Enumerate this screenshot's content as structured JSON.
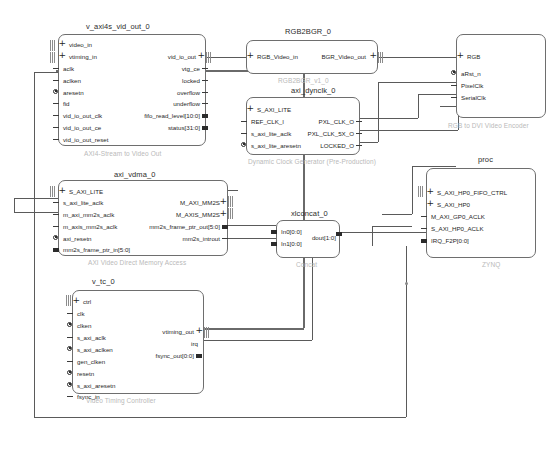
{
  "diagram": {
    "tool": "Vivado IP Integrator Block Design",
    "blocks": [
      {
        "id": "v_axi4s_vid_out_0",
        "title": "v_axi4s_vid_out_0",
        "subtitle": "AXI4-Stream to Video Out",
        "left_ports": [
          {
            "label": "video_in",
            "kind": "iface"
          },
          {
            "label": "vtiming_in",
            "kind": "iface"
          },
          {
            "label": "aclk",
            "kind": "dash"
          },
          {
            "label": "aclken",
            "kind": "dash"
          },
          {
            "label": "aresetn",
            "kind": "rstdot"
          },
          {
            "label": "fid",
            "kind": "dash"
          },
          {
            "label": "vid_io_out_clk",
            "kind": "dash"
          },
          {
            "label": "vid_io_out_ce",
            "kind": "dash"
          },
          {
            "label": "vid_io_out_reset",
            "kind": "dash"
          }
        ],
        "right_ports": [
          {
            "label": "vid_io_out",
            "kind": "iface"
          },
          {
            "label": "vtg_ce",
            "kind": "dash"
          },
          {
            "label": "locked",
            "kind": "dash"
          },
          {
            "label": "overflow",
            "kind": "dash"
          },
          {
            "label": "underflow",
            "kind": "dash"
          },
          {
            "label": "fifo_read_level[10:0]",
            "kind": "bus"
          },
          {
            "label": "status[31:0]",
            "kind": "bus"
          }
        ]
      },
      {
        "id": "RGB2BGR_0",
        "title": "RGB2BGR_0",
        "subtitle": "RGB2BGR_v1_0",
        "left_ports": [
          {
            "label": "RGB_Video_in",
            "kind": "iface"
          }
        ],
        "right_ports": [
          {
            "label": "BGR_Video_out",
            "kind": "iface"
          }
        ]
      },
      {
        "id": "axi_dynclk_0",
        "title": "axi_dynclk_0",
        "subtitle": "Dynamic Clock Generator (Pre-Production)",
        "left_ports": [
          {
            "label": "S_AXI_LITE",
            "kind": "iface"
          },
          {
            "label": "REF_CLK_I",
            "kind": "dash"
          },
          {
            "label": "s_axi_lite_aclk",
            "kind": "dash"
          },
          {
            "label": "s_axi_lite_aresetn",
            "kind": "rstdot"
          }
        ],
        "right_ports": [
          {
            "label": "PXL_CLK_O",
            "kind": "dash"
          },
          {
            "label": "PXL_CLK_5X_O",
            "kind": "dash"
          },
          {
            "label": "LOCKED_O",
            "kind": "dash"
          }
        ]
      },
      {
        "id": "axi_vdma_0",
        "title": "axi_vdma_0",
        "subtitle": "AXI Video Direct Memory Access",
        "left_ports": [
          {
            "label": "S_AXI_LITE",
            "kind": "iface"
          },
          {
            "label": "s_axi_lite_aclk",
            "kind": "dash"
          },
          {
            "label": "m_axi_mm2s_aclk",
            "kind": "dash"
          },
          {
            "label": "m_axis_mm2s_aclk",
            "kind": "dash"
          },
          {
            "label": "axi_resetn",
            "kind": "rstdot"
          },
          {
            "label": "mm2s_frame_ptr_in[5:0]",
            "kind": "bus"
          }
        ],
        "right_ports": [
          {
            "label": "M_AXI_MM2S",
            "kind": "iface"
          },
          {
            "label": "M_AXIS_MM2S",
            "kind": "iface"
          },
          {
            "label": "mm2s_frame_ptr_out[5:0]",
            "kind": "bus"
          },
          {
            "label": "mm2s_introut",
            "kind": "dash"
          }
        ]
      },
      {
        "id": "xlconcat_0",
        "title": "xlconcat_0",
        "subtitle": "Concat",
        "left_ports": [
          {
            "label": "In0[0:0]",
            "kind": "bus"
          },
          {
            "label": "In1[0:0]",
            "kind": "bus"
          }
        ],
        "right_ports": [
          {
            "label": "dout[1:0]",
            "kind": "bus"
          }
        ]
      },
      {
        "id": "v_tc_0",
        "title": "v_tc_0",
        "subtitle": "Video Timing Controller",
        "left_ports": [
          {
            "label": "ctrl",
            "kind": "iface"
          },
          {
            "label": "clk",
            "kind": "dash"
          },
          {
            "label": "clken",
            "kind": "rstdot"
          },
          {
            "label": "s_axi_aclk",
            "kind": "dash"
          },
          {
            "label": "s_axi_aclken",
            "kind": "rstdot"
          },
          {
            "label": "gen_clken",
            "kind": "dash"
          },
          {
            "label": "resetn",
            "kind": "rstdot"
          },
          {
            "label": "s_axi_aresetn",
            "kind": "rstdot"
          },
          {
            "label": "fsync_in",
            "kind": "dash"
          }
        ],
        "right_ports": [
          {
            "label": "vtiming_out",
            "kind": "iface"
          },
          {
            "label": "irq",
            "kind": "dash"
          },
          {
            "label": "fsync_out[0:0]",
            "kind": "bus"
          }
        ]
      },
      {
        "id": "rgb2dvi_0",
        "title": "",
        "subtitle": "RGB to DVI Video Encoder",
        "left_ports": [
          {
            "label": "RGB",
            "kind": "iface"
          },
          {
            "label": "aRst_n",
            "kind": "rstdot"
          },
          {
            "label": "PixelClk",
            "kind": "dash"
          },
          {
            "label": "SerialClk",
            "kind": "dash"
          }
        ],
        "right_ports": []
      },
      {
        "id": "processing_system7_0",
        "title": "proc",
        "subtitle": "ZYNQ",
        "left_ports": [
          {
            "label": "S_AXI_HP0_FIFO_CTRL",
            "kind": "iface"
          },
          {
            "label": "S_AXI_HP0",
            "kind": "iface"
          },
          {
            "label": "M_AXI_GP0_ACLK",
            "kind": "dash"
          },
          {
            "label": "S_AXI_HP0_ACLK",
            "kind": "dash"
          },
          {
            "label": "IRQ_F2P[0:0]",
            "kind": "bus"
          }
        ],
        "right_ports": []
      }
    ]
  }
}
